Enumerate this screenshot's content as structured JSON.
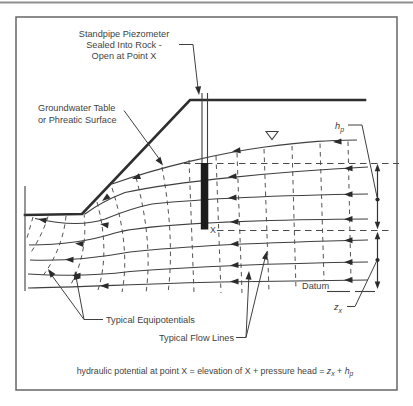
{
  "labels": {
    "standpipe": {
      "line1": "Standpipe Piezometer",
      "line2": "Sealed Into Rock -",
      "line3": "Open at Point X"
    },
    "groundwater": {
      "line1": "Groundwater Table",
      "line2": "or Phreatic Surface"
    },
    "equipotentials": "Typical Equipotentials",
    "flow_lines": "Typical Flow Lines",
    "datum": "Datum",
    "point_x": "X",
    "pressure_head": {
      "symbol": "h",
      "subscript": "p"
    },
    "elevation_head": {
      "symbol": "z",
      "subscript": "x"
    }
  },
  "formula": {
    "lead": "hydraulic potential at point X = elevation of X + pressure head = ",
    "z": "z",
    "z_sub": "x",
    "plus": " + ",
    "h": "h",
    "h_sub": "p"
  },
  "colors": {
    "ink": "#3f3f3f",
    "paper": "#ffffff",
    "seal": "#1c1c1c"
  }
}
